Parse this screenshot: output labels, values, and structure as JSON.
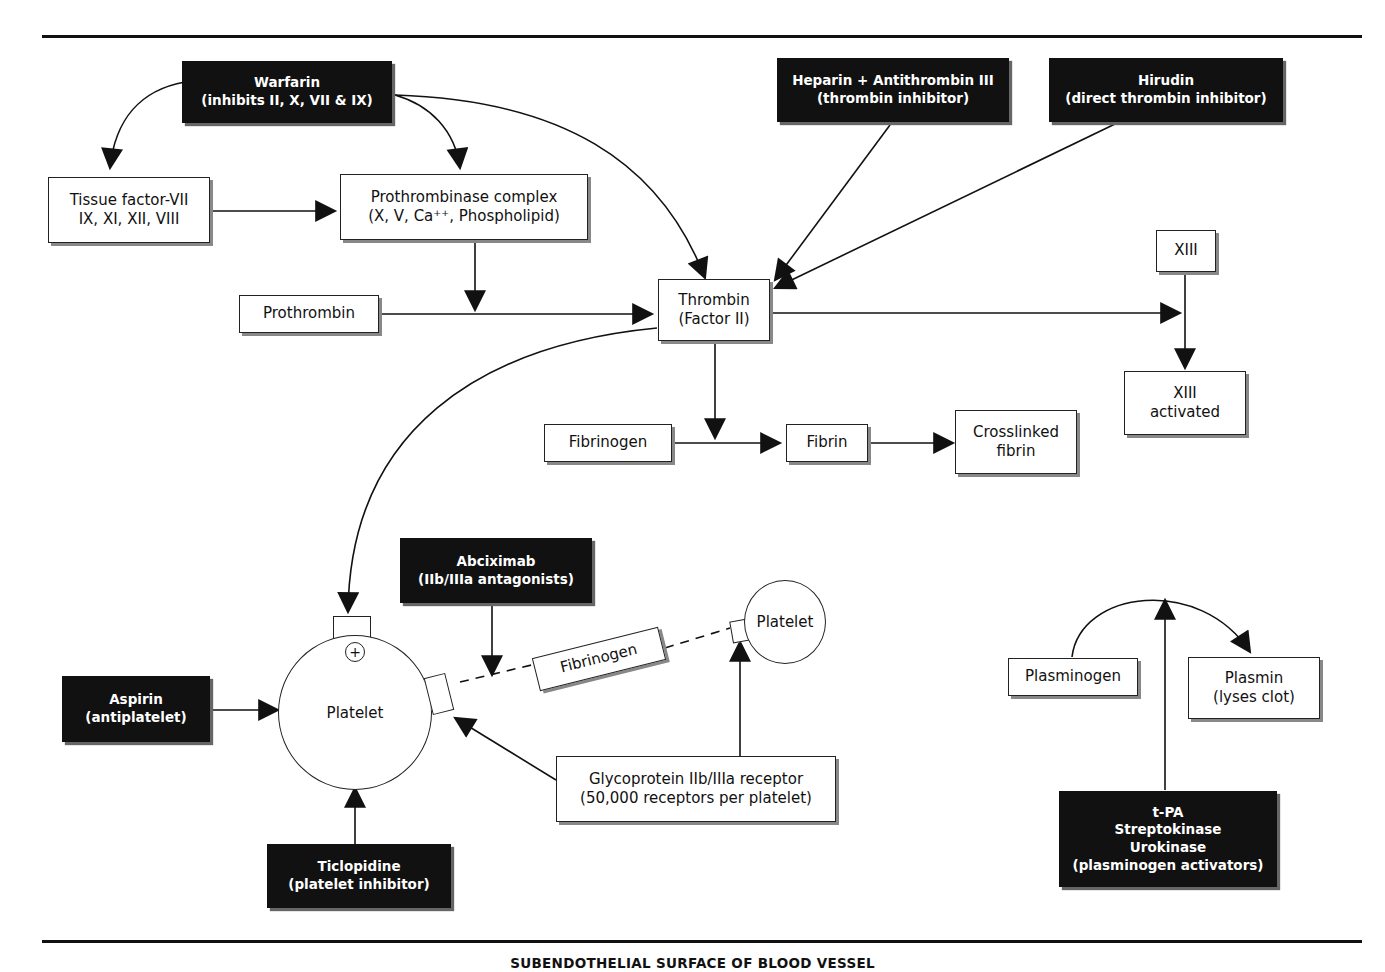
{
  "diagram": {
    "footer_label": "SUBENDOTHELIAL SURFACE OF BLOOD VESSEL",
    "drugs": {
      "warfarin": {
        "line1": "Warfarin",
        "line2": "(inhibits II, X, VII & IX)"
      },
      "heparin": {
        "line1": "Heparin + Antithrombin III",
        "line2": "(thrombin inhibitor)"
      },
      "hirudin": {
        "line1": "Hirudin",
        "line2": "(direct thrombin inhibitor)"
      },
      "abciximab": {
        "line1": "Abciximab",
        "line2": "(IIb/IIIa antagonists)"
      },
      "aspirin": {
        "line1": "Aspirin",
        "line2": "(antiplatelet)"
      },
      "ticlopidine": {
        "line1": "Ticlopidine",
        "line2": "(platelet inhibitor)"
      },
      "plasminogen_activators": {
        "line1": "t-PA",
        "line2": "Streptokinase",
        "line3": "Urokinase",
        "line4": "(plasminogen activators)"
      }
    },
    "nodes": {
      "tissue_factor": {
        "line1": "Tissue factor-VII",
        "line2": "IX, XI, XII, VIII"
      },
      "prothrombinase": {
        "line1": "Prothrombinase complex",
        "line2": "(X, V, Ca⁺⁺, Phospholipid)"
      },
      "prothrombin": {
        "label": "Prothrombin"
      },
      "thrombin": {
        "line1": "Thrombin",
        "line2": "(Factor II)"
      },
      "xiii": {
        "label": "XIII"
      },
      "xiii_activated": {
        "line1": "XIII",
        "line2": "activated"
      },
      "fibrinogen": {
        "label": "Fibrinogen"
      },
      "fibrin": {
        "label": "Fibrin"
      },
      "crosslinked_fibrin": {
        "line1": "Crosslinked",
        "line2": "fibrin"
      },
      "platelet_main": {
        "label": "Platelet",
        "receptor_symbol": "+"
      },
      "platelet_secondary": {
        "label": "Platelet"
      },
      "fibrinogen_bridge": {
        "label": "Fibrinogen"
      },
      "gp_receptor": {
        "line1": "Glycoprotein IIb/IIIa receptor",
        "line2": "(50,000 receptors per platelet)"
      },
      "plasminogen": {
        "label": "Plasminogen"
      },
      "plasmin": {
        "line1": "Plasmin",
        "line2": "(lyses clot)"
      }
    },
    "colors": {
      "drug_box": "#111111",
      "node_box": "#ffffff",
      "line": "#111111"
    }
  }
}
